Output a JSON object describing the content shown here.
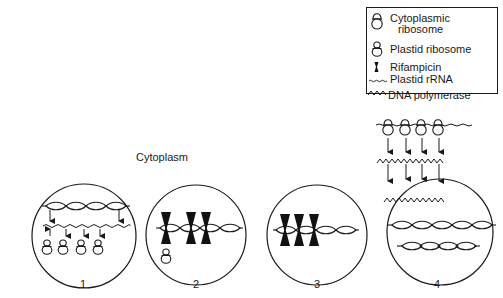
{
  "legend": {
    "items": [
      {
        "icon": "cytoplasmic-ribosome-icon",
        "label_line1": "Cytoplasmic",
        "label_line2": "ribosome"
      },
      {
        "icon": "plastid-ribosome-icon",
        "label": "Plastid ribosome"
      },
      {
        "icon": "rifampicin-icon",
        "label": "Rifampicin"
      },
      {
        "icon": "plastid-rrna-icon",
        "label": "Plastid rRNA"
      },
      {
        "icon": "dna-polymerase-icon",
        "label": "DNA polymerase"
      }
    ]
  },
  "region_label": "Cytoplasm",
  "panels": [
    {
      "number": "1",
      "description": "Plastid DNA transcribed into rRNA, which associates with plastid ribosomes"
    },
    {
      "number": "2",
      "description": "Rifampicin binds plastid DNA; single plastid ribosome present"
    },
    {
      "number": "3",
      "description": "Rifampicin blocks plastid DNA transcription; no ribosomes"
    },
    {
      "number": "4",
      "description": "Cytoplasmic ribosomes translate DNA polymerase imported into plastid; plastid DNA replicates"
    }
  ],
  "colors": {
    "line": "#1a1a1a",
    "background": "#ffffff"
  }
}
